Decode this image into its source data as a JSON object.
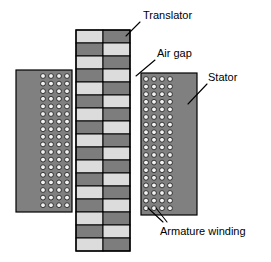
{
  "figure": {
    "background_color": "#ffffff"
  },
  "palette": {
    "stator_body": "#808080",
    "winding_circle": "#f2f2f2",
    "translator_light": "#dcdcdc",
    "translator_dark": "#7d7d7d",
    "outline": "#000000",
    "label_text": "#000000",
    "leader_line": "#000000"
  },
  "labels": [
    {
      "id": "translator",
      "text": "Translator",
      "x": 143,
      "y": 10
    },
    {
      "id": "air-gap",
      "text": "Air gap",
      "x": 157,
      "y": 48
    },
    {
      "id": "stator",
      "text": "Stator",
      "x": 208,
      "y": 72
    },
    {
      "id": "armature-winding",
      "text": "Armature winding",
      "x": 160,
      "y": 226
    }
  ],
  "leaders": [
    {
      "id": "translator-leader",
      "points": "140,22 126,36"
    },
    {
      "id": "air-gap-leader",
      "points": "155,60 136,76"
    },
    {
      "id": "stator-leader",
      "points": "207,84 188,104"
    },
    {
      "id": "armature-leader-a",
      "points": "163,222 148,208"
    },
    {
      "id": "armature-leader-b",
      "points": "167,222 156,208"
    }
  ],
  "stators": [
    {
      "id": "stator-left",
      "x": 16,
      "y": 70,
      "width": 56,
      "height": 142,
      "winding": {
        "columns": 4,
        "rows": 18,
        "start_x": 43,
        "start_y": 76,
        "step_x": 8,
        "step_y": 7.6,
        "radius": 2.4
      }
    },
    {
      "id": "stator-right",
      "x": 141,
      "y": 73,
      "width": 56,
      "height": 142,
      "winding": {
        "columns": 4,
        "rows": 18,
        "start_x": 146,
        "start_y": 79,
        "step_x": 8,
        "step_y": 7.6,
        "radius": 2.4
      }
    }
  ],
  "translator": {
    "id": "translator-body",
    "x": 76,
    "y": 30,
    "width": 54,
    "height": 221,
    "columns": 2,
    "rows": 17,
    "pattern": "checkerboard",
    "row_colors": [
      [
        "light",
        "dark"
      ],
      [
        "dark",
        "light"
      ],
      [
        "light",
        "dark"
      ],
      [
        "dark",
        "light"
      ],
      [
        "light",
        "dark"
      ],
      [
        "dark",
        "light"
      ],
      [
        "light",
        "dark"
      ],
      [
        "dark",
        "light"
      ],
      [
        "light",
        "dark"
      ],
      [
        "dark",
        "light"
      ],
      [
        "light",
        "dark"
      ],
      [
        "dark",
        "light"
      ],
      [
        "light",
        "dark"
      ],
      [
        "dark",
        "light"
      ],
      [
        "light",
        "dark"
      ],
      [
        "dark",
        "light"
      ],
      [
        "light",
        "dark"
      ]
    ]
  }
}
